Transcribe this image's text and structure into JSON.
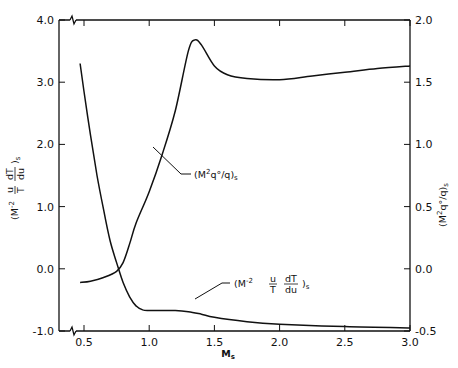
{
  "chart_data": {
    "type": "line",
    "title": "",
    "xlabel": "M_s",
    "ylabel": "(M^-2 u/T dT/du)_s",
    "y2label": "(M^2 q°/q)_s",
    "xlim": [
      0.3,
      3.0
    ],
    "ylim": [
      -1.0,
      4.0
    ],
    "y2lim": [
      -0.5,
      2.0
    ],
    "grid": false,
    "legend": "none (curves labeled with leader-line annotations)",
    "x_ticks": [
      "0.5",
      "1.0",
      "1.5",
      "2.0",
      "2.5",
      "3.0"
    ],
    "y_ticks": [
      "4.0",
      "3.0",
      "2.0",
      "1.0",
      "0.0",
      "-1.0"
    ],
    "y2_ticks": [
      "2.0",
      "1.5",
      "1.0",
      "0.5",
      "0.0",
      "-0.5"
    ],
    "axis_breaks": [
      "x-axis near 0.3-0.4 (bottom and top)"
    ],
    "series": [
      {
        "name": "(M^-2 u/T dT/du)_s",
        "axis": "left",
        "x": [
          0.47,
          0.5,
          0.55,
          0.6,
          0.65,
          0.7,
          0.75,
          0.8,
          0.85,
          0.9,
          0.95,
          1.0,
          1.1,
          1.2,
          1.3,
          1.4,
          1.5,
          1.75,
          2.0,
          2.5,
          3.0
        ],
        "values": [
          3.3,
          2.85,
          2.15,
          1.5,
          0.95,
          0.45,
          0.1,
          -0.22,
          -0.45,
          -0.6,
          -0.66,
          -0.67,
          -0.67,
          -0.67,
          -0.69,
          -0.73,
          -0.78,
          -0.85,
          -0.89,
          -0.93,
          -0.95
        ]
      },
      {
        "name": "(M^2 q°/q)_s",
        "axis": "right",
        "x": [
          0.47,
          0.55,
          0.65,
          0.75,
          0.8,
          0.85,
          0.9,
          1.0,
          1.1,
          1.2,
          1.3,
          1.35,
          1.4,
          1.5,
          1.6,
          1.75,
          2.0,
          2.25,
          2.5,
          2.75,
          3.0
        ],
        "values": [
          -0.11,
          -0.1,
          -0.07,
          -0.02,
          0.05,
          0.2,
          0.37,
          0.62,
          0.92,
          1.27,
          1.75,
          1.84,
          1.8,
          1.63,
          1.56,
          1.53,
          1.52,
          1.55,
          1.58,
          1.61,
          1.63
        ]
      }
    ],
    "annotations": [
      {
        "text": "(M^2 q°/q)_s",
        "points_to": [
          1.03,
          1.07
        ]
      },
      {
        "text": "(M^-2 u/T dT/du)_s",
        "points_to": [
          1.38,
          -0.72
        ]
      }
    ]
  },
  "labels": {
    "x_axis": {
      "main": "M",
      "sub": "s"
    },
    "y_left": {
      "open": "(M",
      "exp": "-2",
      "frac1_num": "u",
      "frac1_den": "T",
      "frac2_num": "dT",
      "frac2_den": "du",
      "close": ")",
      "sub": "s"
    },
    "y_right": {
      "open": "(M",
      "exp": "2",
      "body": "q°/q",
      "close": ")",
      "sub": "s"
    },
    "annot_q": {
      "open": "(M",
      "exp": "2",
      "body": "q°/q",
      "close": ")",
      "sub": "s"
    },
    "annot_t": {
      "open": "(M",
      "exp": "-2",
      "frac1_num": "u",
      "frac1_den": "T",
      "frac2_num": "dT",
      "frac2_den": "du",
      "close": ")",
      "sub": "s"
    }
  },
  "colors": {
    "line": "#111111",
    "background": "#ffffff"
  }
}
